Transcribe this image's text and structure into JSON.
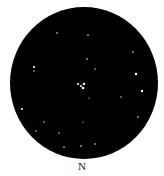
{
  "sketch": {
    "orientation_label": "N",
    "field_color": "#000000",
    "star_color": "#ffffff",
    "stars": [
      {
        "x": 57,
        "y": 33,
        "r": 0.8
      },
      {
        "x": 88,
        "y": 35,
        "r": 0.8
      },
      {
        "x": 133,
        "y": 52,
        "r": 0.8
      },
      {
        "x": 34,
        "y": 67,
        "r": 1.1
      },
      {
        "x": 34,
        "y": 71,
        "r": 0.7
      },
      {
        "x": 87,
        "y": 59,
        "r": 0.8
      },
      {
        "x": 95,
        "y": 69,
        "r": 0.7
      },
      {
        "x": 136,
        "y": 74,
        "r": 1.2
      },
      {
        "x": 78,
        "y": 84,
        "r": 1.0
      },
      {
        "x": 81,
        "y": 86,
        "r": 1.0
      },
      {
        "x": 84,
        "y": 84,
        "r": 1.2
      },
      {
        "x": 83,
        "y": 88,
        "r": 1.3
      },
      {
        "x": 142,
        "y": 91,
        "r": 1.2
      },
      {
        "x": 121,
        "y": 97,
        "r": 0.7
      },
      {
        "x": 89,
        "y": 98,
        "r": 0.6
      },
      {
        "x": 22,
        "y": 109,
        "r": 1.0
      },
      {
        "x": 138,
        "y": 117,
        "r": 0.8
      },
      {
        "x": 44,
        "y": 122,
        "r": 0.7
      },
      {
        "x": 83,
        "y": 122,
        "r": 0.6
      },
      {
        "x": 36,
        "y": 131,
        "r": 0.7
      },
      {
        "x": 59,
        "y": 133,
        "r": 0.7
      },
      {
        "x": 95,
        "y": 144,
        "r": 0.8
      },
      {
        "x": 81,
        "y": 146,
        "r": 0.8
      },
      {
        "x": 64,
        "y": 147,
        "r": 0.8
      }
    ]
  }
}
